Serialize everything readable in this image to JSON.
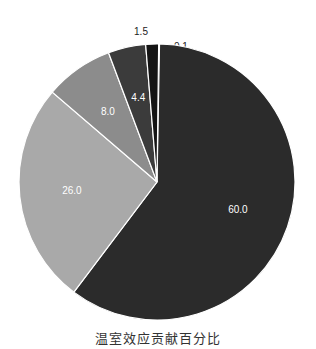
{
  "chart_data": {
    "type": "pie",
    "title": "温室效应贡献百分比",
    "categories": [
      "0.1",
      "60.0",
      "26.0",
      "8.0",
      "4.4",
      "1.5"
    ],
    "values": [
      0.1,
      60.0,
      26.0,
      8.0,
      4.4,
      1.5
    ],
    "labels": [
      "0.1",
      "60.0",
      "26.0",
      "8.0",
      "4.4",
      "1.5"
    ],
    "colors": [
      "#f4f4f4",
      "#2b2b2b",
      "#a9a9a9",
      "#8c8c8c",
      "#3b3b3b",
      "#141414"
    ],
    "start_angle_deg": 90,
    "direction": "clockwise",
    "legend": "none"
  }
}
